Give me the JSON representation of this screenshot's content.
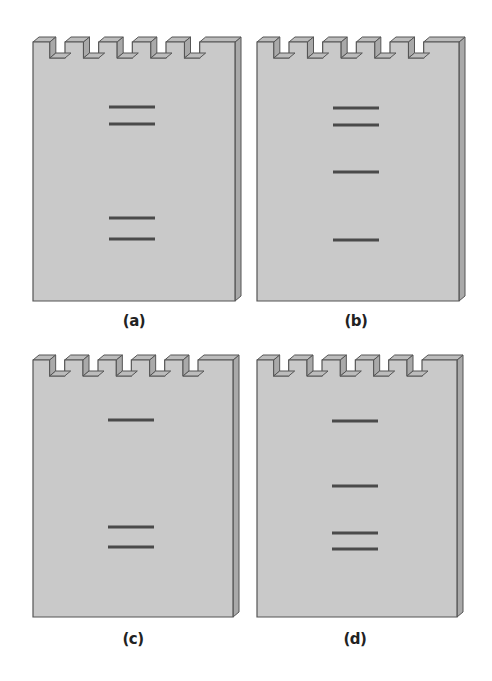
{
  "figure": {
    "panels": [
      {
        "id": "a",
        "label": "(a)",
        "wells": 6,
        "bands_y": [
          107,
          124,
          218,
          239
        ]
      },
      {
        "id": "b",
        "label": "(b)",
        "wells": 6,
        "bands_y": [
          108,
          125,
          172,
          240
        ]
      },
      {
        "id": "c",
        "label": "(c)",
        "wells": 6,
        "bands_y": [
          420,
          527,
          547
        ]
      },
      {
        "id": "d",
        "label": "(d)",
        "wells": 6,
        "bands_y": [
          421,
          486,
          533,
          549
        ]
      }
    ]
  },
  "colors": {
    "gel_face": "#c9c9c9",
    "gel_side": "#a9a9a9",
    "gel_top": "#bcbcbc",
    "outline": "#555555",
    "band": "#4a4a4a"
  }
}
